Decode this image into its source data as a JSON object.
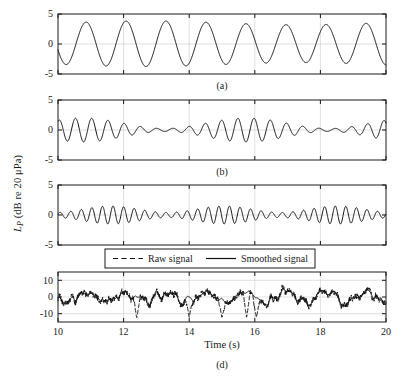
{
  "figure": {
    "y_axis_label_main": "L",
    "y_axis_label_sub": "P",
    "y_axis_label_unit": " (dB re 20 μPa)",
    "x_axis_label": "Time (s)",
    "frame_color": "#1a1a1a",
    "grid_color": "#c9c9c9",
    "line_color": "#111111"
  },
  "legend": {
    "raw_label": "Raw signal",
    "smoothed_label": "Smoothed signal",
    "raw_style": "dashed",
    "smoothed_style": "solid"
  },
  "captions": {
    "a": "(a)",
    "b": "(b)",
    "c": "(c)",
    "d": "(d)"
  },
  "chart_data": [
    {
      "type": "line",
      "panel": "a",
      "title": "(a)",
      "xlabel": "",
      "ylabel": "L_P (dB re 20 μPa)",
      "xlim": [
        10,
        20
      ],
      "ylim": [
        -5,
        5
      ],
      "xticks": [
        10,
        12,
        14,
        16,
        18,
        20
      ],
      "xticklabels": [
        "",
        "",
        "",
        "",
        "",
        ""
      ],
      "yticks": [
        -5,
        0,
        5
      ],
      "yticklabels": [
        "-5",
        "0",
        "5"
      ],
      "grid": true,
      "series": [
        {
          "name": "component 1",
          "style": "solid",
          "description": "clean sinusoid, ~0.82 Hz, amplitude ~3.8 dB with slow amplitude decay near the right edge",
          "synth": {
            "kind": "sine",
            "freq": 0.82,
            "phase": 3.45,
            "amp": 3.8,
            "amp_mod_freq": 0.105,
            "amp_mod_depth": 0.17,
            "amp_mod_phase": 1.4,
            "offset": 0.05,
            "noise": 0.0
          }
        }
      ]
    },
    {
      "type": "line",
      "panel": "b",
      "title": "(b)",
      "xlabel": "",
      "ylabel": "L_P (dB re 20 μPa)",
      "xlim": [
        10,
        20
      ],
      "ylim": [
        -5,
        5
      ],
      "xticks": [
        10,
        12,
        14,
        16,
        18,
        20
      ],
      "xticklabels": [
        "",
        "",
        "",
        "",
        "",
        ""
      ],
      "yticks": [
        -5,
        0,
        5
      ],
      "yticklabels": [
        "-5",
        "0",
        "5"
      ],
      "grid": true,
      "series": [
        {
          "name": "component 2",
          "style": "solid",
          "description": "~2.0 Hz oscillation, strongly amplitude modulated: moderate at left, near-zero around 14-15 s, largest (|y|~3) from 16 s to 20 s",
          "synth": {
            "kind": "sine",
            "freq": 2.02,
            "phase": 1.1,
            "amp": 2.0,
            "amp_mod_freq": 0.2,
            "amp_mod_depth": 0.88,
            "amp_mod_phase": 2.2,
            "offset": 0.0,
            "noise": 0.0
          }
        }
      ]
    },
    {
      "type": "line",
      "panel": "c",
      "title": "(c)",
      "xlabel": "",
      "ylabel": "L_P (dB re 20 μPa)",
      "xlim": [
        10,
        20
      ],
      "ylim": [
        -5,
        5
      ],
      "xticks": [
        10,
        12,
        14,
        16,
        18,
        20
      ],
      "xticklabels": [
        "",
        "",
        "",
        "",
        "",
        ""
      ],
      "yticks": [
        -5,
        0,
        5
      ],
      "yticklabels": [
        "-5",
        "0",
        "5"
      ],
      "grid": true,
      "series": [
        {
          "name": "component 3",
          "style": "solid",
          "description": "~3.1 Hz oscillation with amplitude modulation: small at 10 s, peaks ~2 between 11.5 and 15.5 s, falls to ~0.7 around 17-18 s, modest again near 19-20 s",
          "synth": {
            "kind": "sine",
            "freq": 3.1,
            "phase": 0.3,
            "amp": 1.5,
            "amp_mod_freq": 0.29,
            "amp_mod_depth": 0.72,
            "amp_mod_phase": 0.2,
            "offset": 0.0,
            "noise": 0.0
          }
        }
      ]
    },
    {
      "type": "line",
      "panel": "d",
      "title": "(d)",
      "xlabel": "Time (s)",
      "ylabel": "L_P (dB re 20 μPa)",
      "xlim": [
        10,
        20
      ],
      "ylim": [
        -15,
        15
      ],
      "xticks": [
        10,
        12,
        14,
        16,
        18,
        20
      ],
      "xticklabels": [
        "10",
        "12",
        "14",
        "16",
        "18",
        "20"
      ],
      "yticks": [
        -10,
        0,
        10
      ],
      "yticklabels": [
        "-10",
        "0",
        "10"
      ],
      "grid": true,
      "legend": [
        "Raw signal",
        "Smoothed signal"
      ],
      "legend_position": "upper-center-outside",
      "series": [
        {
          "name": "Raw signal",
          "style": "dashed",
          "description": "noisy broadband trace oscillating mostly between -10 and +8 dB, with sharp negative spikes reaching about -12 near 12.4, 14.0, 15.0, 15.8 and 16.0 s",
          "synth": {
            "kind": "composite",
            "base_freq": 0.82,
            "base_amp": 3.6,
            "harm2_freq": 2.02,
            "harm2_amp": 2.1,
            "harm3_freq": 3.1,
            "harm3_amp": 1.5,
            "noise": 2.6,
            "noise_seed": 17,
            "spike_times": [
              12.4,
              14.0,
              15.0,
              15.75,
              16.05
            ],
            "spike_depth": -12.5
          }
        },
        {
          "name": "Smoothed signal",
          "style": "solid",
          "description": "low-pass version of the raw trace, peaks ~+7 and troughs ~-7, no sharp spikes",
          "synth": {
            "kind": "composite",
            "base_freq": 0.82,
            "base_amp": 3.6,
            "harm2_freq": 2.02,
            "harm2_amp": 2.1,
            "harm3_freq": 3.1,
            "harm3_amp": 1.5,
            "noise": 2.6,
            "noise_seed": 17,
            "smooth_window": 9
          }
        }
      ]
    }
  ]
}
